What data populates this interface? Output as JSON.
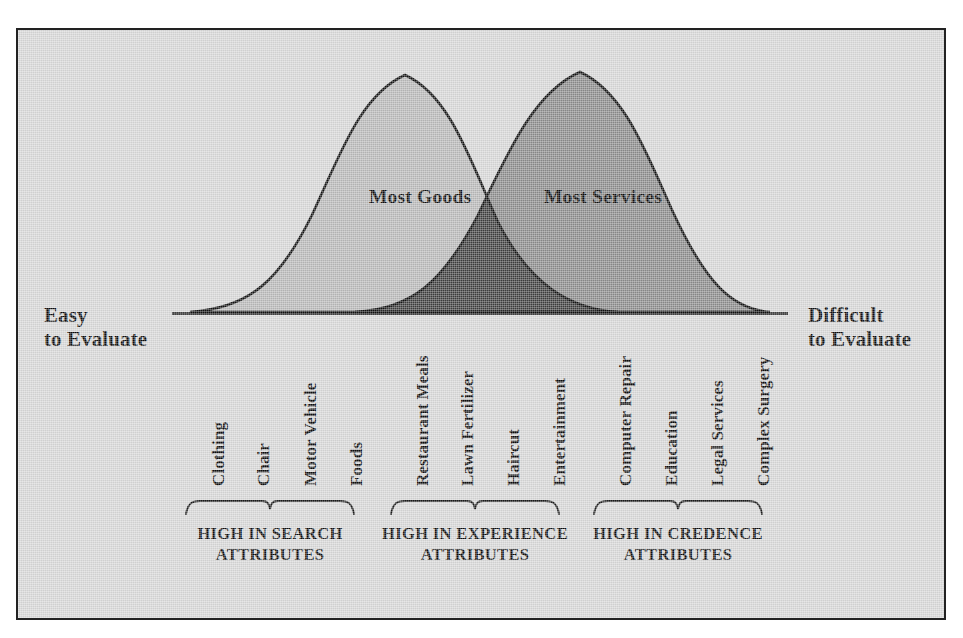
{
  "figure": {
    "background_color": "#d6d6d6",
    "border_color": "#222222",
    "axis": {
      "left_anchor_label": "Easy\nto Evaluate",
      "right_anchor_label": "Difficult\nto Evaluate"
    },
    "curve_labels": {
      "goods": "Most Goods",
      "services": "Most Services"
    }
  },
  "chart_data": {
    "type": "area",
    "xlabel": "",
    "ylabel": "",
    "grid": false,
    "legend_position": "inline-on-curves",
    "axis_annotations": {
      "left": "Easy to Evaluate",
      "right": "Difficult to Evaluate"
    },
    "colors": {
      "goods_fill": "#b8b8b8",
      "services_fill": "#8a8a8a",
      "overlap_fill": "#3e3e3e",
      "curve_stroke": "#111111",
      "background": "#d6d6d6"
    },
    "series": [
      {
        "name": "Most Goods",
        "peak_x": 0.375,
        "peak_y": 1.0,
        "start_x": 0.0,
        "end_x": 0.735,
        "fill": "#b8b8b8"
      },
      {
        "name": "Most Services",
        "peak_x": 0.675,
        "peak_y": 1.0,
        "start_x": 0.285,
        "end_x": 1.0,
        "fill": "#8a8a8a"
      }
    ],
    "crossover_x": 0.545,
    "categories": [
      "Clothing",
      "Chair",
      "Motor Vehicle",
      "Foods",
      "Restaurant Meals",
      "Lawn Fertilizer",
      "Haircut",
      "Entertainment",
      "Computer Repair",
      "Education",
      "Legal Services",
      "Complex Surgery"
    ],
    "category_positions": [
      203,
      248,
      295,
      341,
      407,
      452,
      498,
      544,
      610,
      656,
      702,
      748
    ],
    "groups": [
      {
        "label": "HIGH IN SEARCH\nATTRIBUTES",
        "bracket_start": 185,
        "bracket_end": 355,
        "members": [
          "Clothing",
          "Chair",
          "Motor Vehicle",
          "Foods"
        ]
      },
      {
        "label": "HIGH IN EXPERIENCE\nATTRIBUTES",
        "bracket_start": 390,
        "bracket_end": 560,
        "members": [
          "Restaurant Meals",
          "Lawn Fertilizer",
          "Haircut",
          "Entertainment"
        ]
      },
      {
        "label": "HIGH IN CREDENCE\nATTRIBUTES",
        "bracket_start": 593,
        "bracket_end": 763,
        "members": [
          "Computer Repair",
          "Education",
          "Legal Services",
          "Complex Surgery"
        ]
      }
    ]
  }
}
